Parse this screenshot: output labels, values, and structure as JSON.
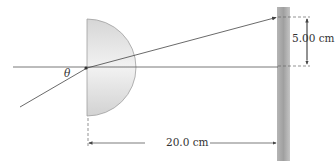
{
  "diagram": {
    "type": "optics-refraction",
    "labels": {
      "angle": "θ",
      "vertical_distance": "5.00 cm",
      "horizontal_distance": "20.0 cm"
    },
    "colors": {
      "lens_fill": "#dcdcdc",
      "lens_edge": "#9a9a9a",
      "screen": "#a8a8a8",
      "line": "#555555"
    },
    "elements": [
      "optical axis",
      "semicircular lens",
      "incident ray",
      "refracted ray",
      "screen",
      "5.00 cm dimension",
      "20.0 cm dimension"
    ]
  }
}
